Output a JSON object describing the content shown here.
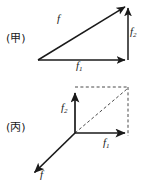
{
  "figure": {
    "width": 149,
    "height": 190,
    "background_color": "#ffffff",
    "stroke_color": "#1a1a1a"
  },
  "panels": [
    {
      "id": "jia",
      "label": "(甲)",
      "method": "triangle",
      "vectors": [
        {
          "name": "f",
          "label": "f",
          "subscript": "",
          "style": "solid",
          "from": [
            38,
            60
          ],
          "to": [
            128,
            5
          ],
          "arrowhead": true
        },
        {
          "name": "f1",
          "label": "f",
          "subscript": "1",
          "style": "solid",
          "from": [
            38,
            60
          ],
          "to": [
            128,
            60
          ],
          "arrowhead": true
        },
        {
          "name": "f2",
          "label": "f",
          "subscript": "2",
          "style": "solid",
          "from": [
            128,
            60
          ],
          "to": [
            128,
            5
          ],
          "arrowhead": true
        }
      ]
    },
    {
      "id": "bing",
      "label": "(丙)",
      "method": "parallelogram",
      "vectors": [
        {
          "name": "f2",
          "label": "f",
          "subscript": "2",
          "style": "solid",
          "from": [
            75,
            133
          ],
          "to": [
            75,
            90
          ],
          "arrowhead": true
        },
        {
          "name": "f1",
          "label": "f",
          "subscript": "1",
          "style": "solid",
          "from": [
            75,
            133
          ],
          "to": [
            128,
            133
          ],
          "arrowhead": true
        },
        {
          "name": "f",
          "label": "f",
          "subscript": "",
          "style": "solid",
          "from": [
            75,
            133
          ],
          "to": [
            32,
            175
          ],
          "arrowhead": true
        },
        {
          "name": "diagonal",
          "label": "",
          "subscript": "",
          "style": "dashed",
          "from": [
            75,
            133
          ],
          "to": [
            128,
            88
          ],
          "arrowhead": false
        },
        {
          "name": "top-edge",
          "label": "",
          "subscript": "",
          "style": "dashed",
          "from": [
            75,
            87
          ],
          "to": [
            128,
            87
          ],
          "arrowhead": false
        },
        {
          "name": "right-edge",
          "label": "",
          "subscript": "",
          "style": "dashed",
          "from": [
            128,
            87
          ],
          "to": [
            128,
            136
          ],
          "arrowhead": false
        }
      ]
    }
  ],
  "labels": {
    "panel_jia": "(甲)",
    "panel_bing": "(丙)",
    "top_f": "f",
    "top_f1_base": "f",
    "top_f1_sub": "1",
    "top_f2_base": "f",
    "top_f2_sub": "2",
    "bottom_f2_base": "f",
    "bottom_f2_sub": "2",
    "bottom_f1_base": "f",
    "bottom_f1_sub": "1",
    "bottom_f": "f"
  }
}
